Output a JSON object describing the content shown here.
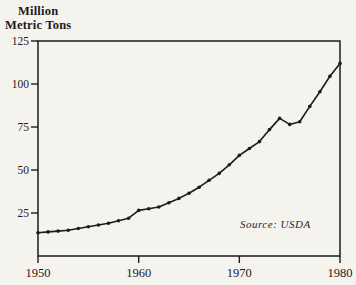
{
  "page": {
    "background": "#f5f3ee",
    "ink_color": "#1b1b1b"
  },
  "chart": {
    "title_line1": "Million",
    "title_line2": "Metric Tons",
    "source_label": "Source: USDA",
    "y_tick_labels": [
      "25",
      "50",
      "75",
      "100",
      "125"
    ],
    "x_tick_labels": [
      "1950",
      "1960",
      "1970",
      "1980"
    ]
  },
  "chart_data": {
    "type": "line",
    "title": "Million Metric Tons",
    "ylabel": "Million Metric Tons",
    "xlabel": "",
    "annotation": "Source: USDA",
    "x": [
      1950,
      1951,
      1952,
      1953,
      1954,
      1955,
      1956,
      1957,
      1958,
      1959,
      1960,
      1961,
      1962,
      1963,
      1964,
      1965,
      1966,
      1967,
      1968,
      1969,
      1970,
      1971,
      1972,
      1973,
      1974,
      1975,
      1976,
      1977,
      1978,
      1979,
      1980
    ],
    "values": [
      13.5,
      14,
      14.5,
      15,
      16,
      17,
      18,
      19,
      20.5,
      22,
      26.5,
      27.5,
      28.5,
      31,
      33.5,
      36.5,
      40,
      44,
      48,
      53,
      58.5,
      62.5,
      66.5,
      73.5,
      80,
      76.5,
      78,
      87,
      95.5,
      104.5,
      112
    ],
    "xlim": [
      1950,
      1980
    ],
    "ylim": [
      0,
      125
    ],
    "yticks": [
      25,
      50,
      75,
      100,
      125
    ],
    "xticks": [
      1950,
      1960,
      1970,
      1980
    ],
    "grid": false,
    "legend": false,
    "marker": "dot",
    "line_color": "#1b1b1b",
    "plot_box": "full-rectangle"
  }
}
